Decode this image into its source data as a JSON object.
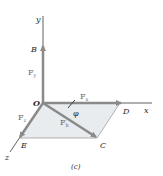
{
  "figure": {
    "caption": "(c)",
    "axes": {
      "x": "x",
      "y": "y",
      "z": "z"
    },
    "points": {
      "origin": "O",
      "B": "B",
      "C": "C",
      "D": "D",
      "E": "E"
    },
    "forces": {
      "Fy": {
        "label": "F",
        "sub": "y"
      },
      "Fx": {
        "label": "F",
        "sub": "x"
      },
      "Fz": {
        "label": "F",
        "sub": "z"
      },
      "Fh": {
        "label": "F",
        "sub": "h"
      }
    },
    "angle": "φ",
    "colors": {
      "axis": "#3a3a3a",
      "arrow": "#8a8a8a",
      "plane": "#e8ecef",
      "plane_edge": "#9a9a9a"
    }
  }
}
